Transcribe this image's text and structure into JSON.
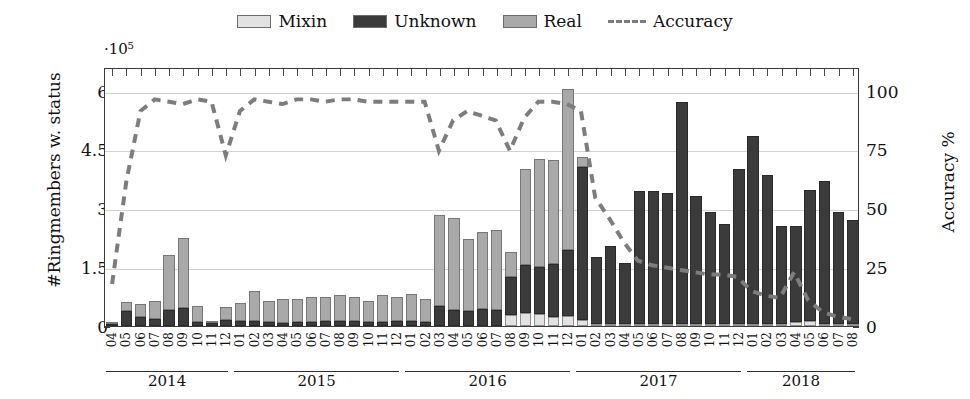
{
  "chart_data": {
    "type": "bar",
    "subtype": "stacked-bar-with-line",
    "title": "",
    "ylabel": "#Ringmembers w. status",
    "ylabel_right": "Accuracy %",
    "y_multiplier": "·10⁵",
    "xlabel": "",
    "ylim": [
      0,
      6.6
    ],
    "ylim_right": [
      0,
      110
    ],
    "yticks": [
      "0",
      "1.5",
      "3",
      "4.5",
      "6"
    ],
    "ytick_values": [
      0,
      1.5,
      3,
      4.5,
      6
    ],
    "yticks_right": [
      "0",
      "25",
      "50",
      "75",
      "100"
    ],
    "ytick_values_right": [
      0,
      25,
      50,
      75,
      100
    ],
    "grid": true,
    "legend_position": "top-center",
    "legend": [
      {
        "label": "Mixin",
        "color": "#e2e2e2",
        "marker": "square"
      },
      {
        "label": "Unknown",
        "color": "#3b3b3b",
        "marker": "square"
      },
      {
        "label": "Real",
        "color": "#a9a9a9",
        "marker": "square"
      },
      {
        "label": "Accuracy",
        "color": "#7d7d7d",
        "marker": "dashed-line"
      }
    ],
    "categories": [
      "04",
      "05",
      "06",
      "07",
      "08",
      "09",
      "10",
      "11",
      "12",
      "01",
      "02",
      "03",
      "04",
      "05",
      "06",
      "07",
      "08",
      "09",
      "10",
      "11",
      "12",
      "01",
      "02",
      "03",
      "04",
      "05",
      "06",
      "07",
      "08",
      "09",
      "10",
      "11",
      "12",
      "01",
      "02",
      "03",
      "04",
      "05",
      "06",
      "07",
      "08",
      "09",
      "10",
      "11",
      "12",
      "01",
      "02",
      "03",
      "04",
      "05",
      "06",
      "07",
      "08"
    ],
    "year_groups": [
      {
        "label": "2014",
        "start_index": 0,
        "count": 9
      },
      {
        "label": "2015",
        "start_index": 9,
        "count": 12
      },
      {
        "label": "2016",
        "start_index": 21,
        "count": 12
      },
      {
        "label": "2017",
        "start_index": 33,
        "count": 12
      },
      {
        "label": "2018",
        "start_index": 45,
        "count": 8
      }
    ],
    "series": [
      {
        "name": "Mixin",
        "color": "#e2e2e2",
        "values": [
          0.0,
          0.0,
          0.0,
          0.0,
          0.0,
          0.0,
          0.0,
          0.0,
          0.0,
          0.0,
          0.0,
          0.0,
          0.0,
          0.0,
          0.0,
          0.0,
          0.0,
          0.0,
          0.0,
          0.0,
          0.0,
          0.0,
          0.0,
          0.0,
          0.0,
          0.0,
          0.0,
          0.0,
          0.28,
          0.33,
          0.3,
          0.22,
          0.26,
          0.15,
          0.04,
          0.03,
          0.02,
          0.02,
          0.02,
          0.02,
          0.02,
          0.02,
          0.02,
          0.02,
          0.02,
          0.02,
          0.02,
          0.02,
          0.1,
          0.12,
          0.02,
          0.02,
          0.02
        ]
      },
      {
        "name": "Unknown",
        "color": "#3b3b3b",
        "values": [
          0.06,
          0.38,
          0.22,
          0.18,
          0.42,
          0.45,
          0.1,
          0.07,
          0.16,
          0.12,
          0.12,
          0.1,
          0.08,
          0.1,
          0.1,
          0.12,
          0.12,
          0.12,
          0.1,
          0.1,
          0.12,
          0.12,
          0.1,
          0.52,
          0.4,
          0.38,
          0.44,
          0.4,
          0.98,
          1.22,
          1.2,
          1.35,
          1.67,
          3.9,
          1.72,
          2.0,
          1.55,
          3.4,
          3.4,
          3.35,
          5.65,
          3.25,
          2.85,
          2.55,
          3.95,
          4.8,
          3.8,
          2.5,
          2.45,
          3.35,
          3.65,
          2.85,
          2.65
        ]
      },
      {
        "name": "Real",
        "color": "#a9a9a9",
        "values": [
          0.04,
          0.22,
          0.33,
          0.45,
          1.38,
          1.8,
          0.42,
          0.06,
          0.33,
          0.47,
          0.76,
          0.55,
          0.62,
          0.58,
          0.65,
          0.62,
          0.68,
          0.62,
          0.55,
          0.68,
          0.62,
          0.7,
          0.58,
          2.32,
          2.35,
          1.85,
          1.95,
          2.05,
          0.62,
          2.45,
          2.75,
          2.65,
          4.12,
          0.25,
          0.0,
          0.0,
          0.0,
          0.0,
          0.0,
          0.0,
          0.0,
          0.0,
          0.0,
          0.0,
          0.0,
          0.0,
          0.0,
          0.0,
          0.0,
          0.0,
          0.0,
          0.0,
          0.0
        ]
      }
    ],
    "line_series": {
      "name": "Accuracy",
      "color": "#7d7d7d",
      "axis": "right",
      "unit": "%",
      "values": [
        18,
        62,
        92,
        97,
        96,
        95,
        97,
        96,
        73,
        92,
        97,
        96,
        95,
        97,
        97,
        96,
        97,
        97,
        96,
        96,
        96,
        96,
        96,
        75,
        88,
        92,
        90,
        88,
        75,
        89,
        96,
        96,
        95,
        92,
        55,
        46,
        36,
        28,
        26,
        25,
        24,
        23,
        22,
        22,
        21,
        15,
        13,
        12,
        23,
        11,
        6,
        4,
        3
      ]
    }
  },
  "figure": {
    "width": 970,
    "height": 399
  }
}
